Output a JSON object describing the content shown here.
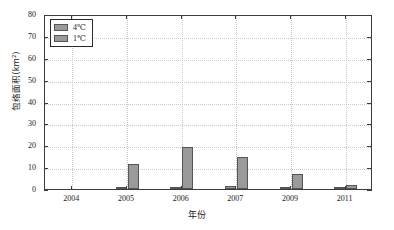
{
  "chart_data": {
    "type": "bar",
    "title": "",
    "xlabel": "年份",
    "ylabel": "包络面积(km²)",
    "categories": [
      "2004",
      "2005",
      "2006",
      "2007",
      "2009",
      "2011"
    ],
    "series": [
      {
        "name": "4℃",
        "values": [
          0,
          0.7,
          1.0,
          1.3,
          1.0,
          0.5
        ],
        "color": "#9a9a9a"
      },
      {
        "name": "1℃",
        "values": [
          0,
          11.3,
          19.0,
          14.5,
          6.8,
          2.0
        ],
        "color": "#9a9a9a"
      }
    ],
    "ylim": [
      0,
      80
    ],
    "yticks": [
      0,
      10,
      20,
      30,
      40,
      50,
      60,
      70,
      80
    ],
    "ytick_labels": [
      "0",
      "10",
      "20",
      "30",
      "40",
      "50",
      "60",
      "70",
      "80"
    ],
    "xtick_labels": [
      "2004",
      "2005",
      "2006",
      "2007",
      "2009",
      "2011"
    ],
    "grid": true,
    "grid_style": "dotted",
    "legend_position": "upper-left",
    "legend_entries": [
      "4℃",
      "1℃"
    ],
    "axis_color": "#3c3c3c",
    "grid_color": "#c8c8c8",
    "background": "#ffffff"
  }
}
